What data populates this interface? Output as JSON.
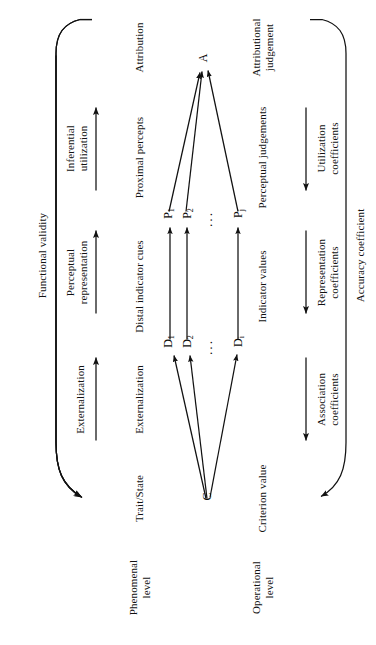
{
  "figure": {
    "ink_color": "#121212",
    "background": "#ffffff"
  },
  "nodes": {
    "criterion": "C",
    "attribution": "A",
    "distal": [
      "D",
      "D",
      "D"
    ],
    "distal_subs": [
      "1",
      "2",
      "i"
    ],
    "proximal": [
      "P",
      "P",
      "P"
    ],
    "proximal_subs": [
      "1",
      "2",
      "j"
    ],
    "ellipsis": "···"
  },
  "phenomenal_side": {
    "level_label": "Phenomenal\nlevel",
    "outer_arc_label": "Functional validity",
    "stages": [
      {
        "name": "Trait/State"
      },
      {
        "name": "Externalization"
      },
      {
        "name": "Distal indicator cues"
      },
      {
        "name": "Perceptual\nrepresentation"
      },
      {
        "name": "Proximal percepts"
      },
      {
        "name": "Inferential\nutilization"
      },
      {
        "name": "Attribution"
      }
    ]
  },
  "operational_side": {
    "level_label": "Operational\nlevel",
    "outer_arc_label": "Accuracy coefficient",
    "stages": [
      {
        "name": "Criterion value"
      },
      {
        "name": "Association\ncoefficients"
      },
      {
        "name": "Indicator values"
      },
      {
        "name": "Representation\ncoefficients"
      },
      {
        "name": "Perceptual judgements"
      },
      {
        "name": "Utilization\ncoefficients"
      },
      {
        "name": "Attributional\njudgement"
      }
    ]
  },
  "arrows": {
    "phenomenal_direction": "left-to-right",
    "operational_direction": "right-to-left",
    "count_per_side": 3
  }
}
